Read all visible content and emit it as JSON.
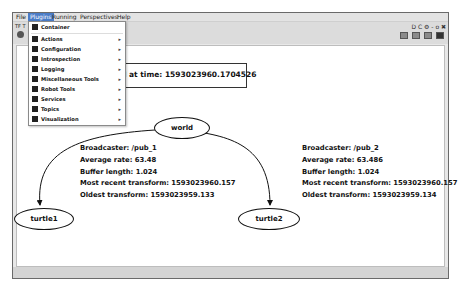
{
  "menubar": {
    "items": [
      "File",
      "Plugins",
      "Running",
      "Perspectives",
      "Help"
    ],
    "active": "Plugins"
  },
  "toolbar": {
    "plugin_title": "TF T",
    "window_controls": "D C ⚙ - o ✖"
  },
  "plugins_menu": {
    "items": [
      {
        "label": "Container",
        "submenu": false
      },
      {
        "label": "Actions",
        "submenu": true
      },
      {
        "label": "Configuration",
        "submenu": true
      },
      {
        "label": "Introspection",
        "submenu": true
      },
      {
        "label": "Logging",
        "submenu": true
      },
      {
        "label": "Miscellaneous Tools",
        "submenu": true
      },
      {
        "label": "Robot Tools",
        "submenu": true
      },
      {
        "label": "Services",
        "submenu": true
      },
      {
        "label": "Topics",
        "submenu": true
      },
      {
        "label": "Visualization",
        "submenu": true
      }
    ]
  },
  "graph": {
    "recorded_label": "d at time: 1593023960.1704526",
    "nodes": {
      "world": "world",
      "turtle1": "turtle1",
      "turtle2": "turtle2"
    },
    "edge1": {
      "broadcaster": "Broadcaster: /pub_1",
      "average_rate": "Average rate: 63.48",
      "buffer_length": "Buffer length: 1.024",
      "most_recent": "Most recent transform: 1593023960.157",
      "oldest": "Oldest transform: 1593023959.133"
    },
    "edge2": {
      "broadcaster": "Broadcaster: /pub_2",
      "average_rate": "Average rate: 63.486",
      "buffer_length": "Buffer length: 1.024",
      "most_recent": "Most recent transform: 1593023960.157",
      "oldest": "Oldest transform: 1593023959.134"
    }
  }
}
